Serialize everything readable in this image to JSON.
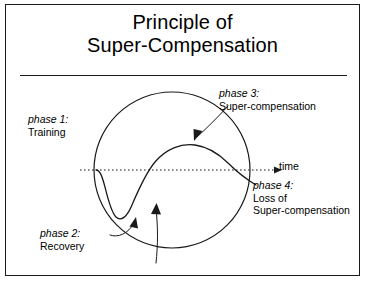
{
  "slide": {
    "title_line1": "Principle of",
    "title_line2": "Super-Compensation"
  },
  "diagram": {
    "axis_label": "time",
    "labels": [
      {
        "id": "phase1",
        "heading": "phase 1:",
        "text": "Training"
      },
      {
        "id": "phase2",
        "heading": "phase 2:",
        "text": "Recovery"
      },
      {
        "id": "phase3",
        "heading": "phase 3:",
        "text": "Super-compensation"
      },
      {
        "id": "phase4",
        "heading": "phase 4:",
        "text_line1": "Loss of",
        "text_line2": "Super-compensation"
      }
    ]
  },
  "colors": {
    "ink": "#1a1a1a",
    "background": "#ffffff"
  }
}
